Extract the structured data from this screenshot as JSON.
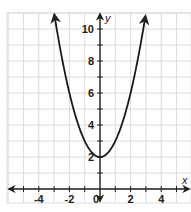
{
  "chart_data": {
    "type": "line",
    "title": "",
    "function": "y = x^2 + 2",
    "xlabel": "x",
    "ylabel": "y",
    "xlim": [
      -6,
      6
    ],
    "ylim": [
      -1,
      11
    ],
    "grid": true,
    "x_tick_labels": [
      "-4",
      "-2",
      "0",
      "2",
      "4"
    ],
    "x_tick_values": [
      -4,
      -2,
      0,
      2,
      4
    ],
    "y_tick_labels": [
      "2",
      "4",
      "6",
      "8",
      "10"
    ],
    "y_tick_values": [
      2,
      4,
      6,
      8,
      10
    ],
    "series": [
      {
        "name": "parabola",
        "x": [
          -3,
          -2.5,
          -2,
          -1.5,
          -1,
          -0.5,
          0,
          0.5,
          1,
          1.5,
          2,
          2.5,
          3
        ],
        "y": [
          11,
          8.25,
          6,
          4.25,
          3,
          2.25,
          2,
          2.25,
          3,
          4.25,
          6,
          8.25,
          11
        ]
      }
    ],
    "vertex": [
      0,
      2
    ],
    "legend": null
  },
  "colors": {
    "curve": "#1a1a1a",
    "axis": "#222222",
    "grid": "#d4d4d4",
    "background": "#ffffff"
  }
}
